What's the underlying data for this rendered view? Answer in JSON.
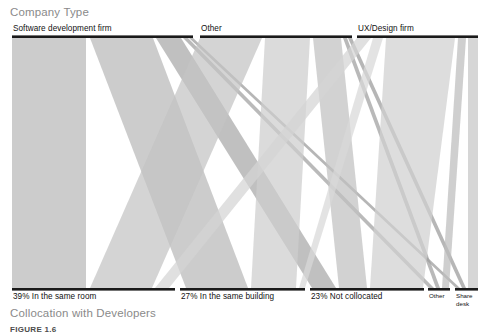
{
  "figure": {
    "caption": "FIGURE 1.6"
  },
  "top_axis": {
    "title": "Company Type",
    "segments": [
      {
        "label": "Software development firm",
        "x0": 12,
        "x1": 193,
        "color": "#b4b4b4"
      },
      {
        "label": "Other",
        "x0": 200,
        "x1": 352,
        "color": "#c0c0c0"
      },
      {
        "label": "UX/Design firm",
        "x0": 357,
        "x1": 478,
        "color": "#cfcfcf"
      }
    ]
  },
  "bottom_axis": {
    "title": "Collocation with Developers",
    "segments": [
      {
        "label": "39% In the same room",
        "x0": 12,
        "x1": 175,
        "color": "#b4b4b4"
      },
      {
        "label": "27% In the same building",
        "x0": 180,
        "x1": 305,
        "color": "#c0c0c0"
      },
      {
        "label": "23% Not collocated",
        "x0": 310,
        "x1": 424,
        "color": "#c8c8c8"
      },
      {
        "label": "Other",
        "x0": 428,
        "x1": 450,
        "color": "#d2d2d2"
      },
      {
        "label": "Share desk",
        "x0": 455,
        "x1": 478,
        "color": "#d6d6d6"
      }
    ]
  },
  "colors": {
    "axis_line": "#1a1a1a",
    "title_gray": "#8a8a8a",
    "label_black": "#111111",
    "background": "#ffffff",
    "caption_gray": "#4b4b4b"
  },
  "chart_data": {
    "type": "sankey",
    "xlabel": "",
    "ylabel": "",
    "grid": false,
    "legend": "none",
    "plot_area": {
      "x0": 12,
      "x1": 478,
      "y_top": 38,
      "y_bottom": 288
    },
    "source_label": "Company Type",
    "target_label": "Collocation with Developers",
    "sources": [
      {
        "name": "Software development firm",
        "x0": 12,
        "x1": 193,
        "width": 181
      },
      {
        "name": "Other",
        "x0": 200,
        "x1": 352,
        "width": 152
      },
      {
        "name": "UX/Design firm",
        "x0": 357,
        "x1": 478,
        "width": 121
      }
    ],
    "targets": [
      {
        "name": "39% In the same room",
        "x0": 12,
        "x1": 175,
        "width": 163
      },
      {
        "name": "27% In the same building",
        "x0": 180,
        "x1": 305,
        "width": 125
      },
      {
        "name": "23% Not collocated",
        "x0": 310,
        "x1": 424,
        "width": 114
      },
      {
        "name": "Other",
        "x0": 428,
        "x1": 450,
        "width": 22
      },
      {
        "name": "Share desk",
        "x0": 455,
        "x1": 478,
        "width": 23
      }
    ],
    "ribbons": [
      {
        "source": "Software development firm",
        "target": "39% In the same room",
        "sx0": 12,
        "sx1": 86,
        "tx0": 12,
        "tx1": 86,
        "color": "#b9b9b9",
        "opacity": 1
      },
      {
        "source": "Software development firm",
        "target": "27% In the same building",
        "sx0": 90,
        "sx1": 153,
        "tx0": 186,
        "tx1": 248,
        "color": "#b9b9b9",
        "opacity": 1
      },
      {
        "source": "Software development firm",
        "target": "23% Not collocated",
        "sx0": 156,
        "sx1": 181,
        "tx0": 312,
        "tx1": 336,
        "color": "#a8a8a8",
        "opacity": 1
      },
      {
        "source": "Software development firm",
        "target": "Other",
        "sx0": 183,
        "sx1": 188,
        "tx0": 429,
        "tx1": 434,
        "color": "#a0a0a0",
        "opacity": 1
      },
      {
        "source": "Software development firm",
        "target": "Share desk",
        "sx0": 189,
        "sx1": 193,
        "tx0": 456,
        "tx1": 460,
        "color": "#9a9a9a",
        "opacity": 1
      },
      {
        "source": "Other",
        "target": "39% In the same room",
        "sx0": 200,
        "sx1": 262,
        "tx0": 90,
        "tx1": 152,
        "color": "#c4c4c4",
        "opacity": 1
      },
      {
        "source": "Other",
        "target": "27% In the same building",
        "sx0": 265,
        "sx1": 310,
        "tx0": 251,
        "tx1": 296,
        "color": "#cdcdcd",
        "opacity": 1
      },
      {
        "source": "Other",
        "target": "23% Not collocated",
        "sx0": 313,
        "sx1": 341,
        "tx0": 339,
        "tx1": 367,
        "color": "#c0c0c0",
        "opacity": 1
      },
      {
        "source": "Other",
        "target": "Other",
        "sx0": 343,
        "sx1": 347,
        "tx0": 436,
        "tx1": 440,
        "color": "#9e9e9e",
        "opacity": 1
      },
      {
        "source": "Other",
        "target": "Share desk",
        "sx0": 348,
        "sx1": 352,
        "tx0": 462,
        "tx1": 466,
        "color": "#9a9a9a",
        "opacity": 1
      },
      {
        "source": "UX/Design firm",
        "target": "39% In the same room",
        "sx0": 357,
        "sx1": 371,
        "tx0": 155,
        "tx1": 169,
        "color": "#d4d4d4",
        "opacity": 1
      },
      {
        "source": "UX/Design firm",
        "target": "27% In the same building",
        "sx0": 373,
        "sx1": 383,
        "tx0": 299,
        "tx1": 305,
        "color": "#d8d8d8",
        "opacity": 1
      },
      {
        "source": "UX/Design firm",
        "target": "23% Not collocated",
        "sx0": 386,
        "sx1": 455,
        "tx0": 370,
        "tx1": 423,
        "color": "#d0d0d0",
        "opacity": 1
      },
      {
        "source": "UX/Design firm",
        "target": "Other",
        "sx0": 458,
        "sx1": 466,
        "tx0": 442,
        "tx1": 449,
        "color": "#bdbdbd",
        "opacity": 1
      },
      {
        "source": "UX/Design firm",
        "target": "Share desk",
        "sx0": 468,
        "sx1": 478,
        "tx0": 468,
        "tx1": 478,
        "color": "#c6c6c6",
        "opacity": 1
      }
    ]
  }
}
